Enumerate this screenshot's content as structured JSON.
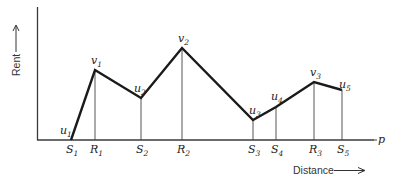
{
  "diagram": {
    "y_axis_label": "Rent",
    "x_axis_label": "Distance",
    "axis_end_label": "p",
    "baseline_points": [
      {
        "id": "S1",
        "letter": "S",
        "sub": "1",
        "x": 71
      },
      {
        "id": "R1",
        "letter": "R",
        "sub": "1",
        "x": 95
      },
      {
        "id": "S2",
        "letter": "S",
        "sub": "2",
        "x": 141
      },
      {
        "id": "R2",
        "letter": "R",
        "sub": "2",
        "x": 182
      },
      {
        "id": "S3",
        "letter": "S",
        "sub": "3",
        "x": 253
      },
      {
        "id": "S4",
        "letter": "S",
        "sub": "4",
        "x": 276
      },
      {
        "id": "R3",
        "letter": "R",
        "sub": "3",
        "x": 314
      },
      {
        "id": "S5",
        "letter": "S",
        "sub": "5",
        "x": 342
      }
    ],
    "curve_points": [
      {
        "id": "u1",
        "letter": "u",
        "sub": "1",
        "x": 71,
        "y": 140
      },
      {
        "id": "v1",
        "letter": "v",
        "sub": "1",
        "x": 95,
        "y": 70
      },
      {
        "id": "u2",
        "letter": "u",
        "sub": "2",
        "x": 141,
        "y": 98
      },
      {
        "id": "v2",
        "letter": "v",
        "sub": "2",
        "x": 182,
        "y": 48
      },
      {
        "id": "u3",
        "letter": "u",
        "sub": "3",
        "x": 253,
        "y": 120
      },
      {
        "id": "u4",
        "letter": "u",
        "sub": "4",
        "x": 276,
        "y": 107
      },
      {
        "id": "v3",
        "letter": "v",
        "sub": "3",
        "x": 314,
        "y": 82
      },
      {
        "id": "u5",
        "letter": "u",
        "sub": "5",
        "x": 342,
        "y": 90
      }
    ],
    "labels": {
      "u1": "u",
      "u1_sub": "1",
      "v1": "v",
      "v1_sub": "1",
      "u2": "u",
      "u2_sub": "2",
      "v2": "v",
      "v2_sub": "2",
      "u3": "u",
      "u3_sub": "3",
      "u4": "u",
      "u4_sub": "4",
      "v3": "v",
      "v3_sub": "3",
      "u5": "u",
      "u5_sub": "5",
      "S1": "S",
      "S1_sub": "1",
      "R1": "R",
      "R1_sub": "1",
      "S2": "S",
      "S2_sub": "2",
      "R2": "R",
      "R2_sub": "2",
      "S3": "S",
      "S3_sub": "3",
      "S4": "S",
      "S4_sub": "4",
      "R3": "R",
      "R3_sub": "3",
      "S5": "S",
      "S5_sub": "5"
    }
  }
}
